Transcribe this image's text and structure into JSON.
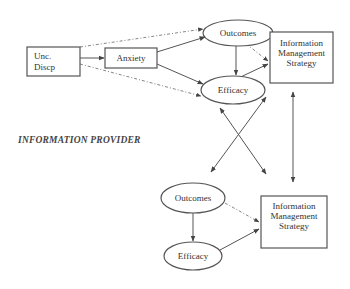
{
  "diagram": {
    "section_label": "INFORMATION PROVIDER",
    "upper": {
      "unc_discp": {
        "line1": "Unc.",
        "line2": "Discp"
      },
      "anxiety": "Anxiety",
      "outcomes": "Outcomes",
      "efficacy": "Efficacy",
      "ims": {
        "line1": "Information",
        "line2": "Management",
        "line3": "Strategy"
      }
    },
    "lower": {
      "outcomes": "Outcomes",
      "efficacy": "Efficacy",
      "ims": {
        "line1": "Information",
        "line2": "Management",
        "line3": "Strategy"
      }
    },
    "edges": [
      {
        "from": "Unc. Discp",
        "to": "Anxiety",
        "style": "solid"
      },
      {
        "from": "Unc. Discp",
        "to": "Outcomes (upper)",
        "style": "dashed"
      },
      {
        "from": "Unc. Discp",
        "to": "Efficacy (upper)",
        "style": "dashed"
      },
      {
        "from": "Anxiety",
        "to": "Outcomes (upper)",
        "style": "solid"
      },
      {
        "from": "Anxiety",
        "to": "Efficacy (upper)",
        "style": "solid"
      },
      {
        "from": "Outcomes (upper)",
        "to": "Efficacy (upper)",
        "style": "solid"
      },
      {
        "from": "Outcomes (upper)",
        "to": "Information Management Strategy (upper)",
        "style": "dashed"
      },
      {
        "from": "Efficacy (upper)",
        "to": "Information Management Strategy (upper)",
        "style": "solid"
      },
      {
        "from": "Efficacy (upper)",
        "to": "Information Management Strategy (lower)",
        "style": "solid",
        "bidirectional": true
      },
      {
        "from": "Information Management Strategy (upper)",
        "to": "Outcomes (lower)",
        "style": "solid",
        "bidirectional": true
      },
      {
        "from": "Information Management Strategy (upper)",
        "to": "Information Management Strategy (lower)",
        "style": "solid",
        "bidirectional": true
      },
      {
        "from": "Outcomes (lower)",
        "to": "Efficacy (lower)",
        "style": "solid"
      },
      {
        "from": "Outcomes (lower)",
        "to": "Information Management Strategy (lower)",
        "style": "dashed"
      },
      {
        "from": "Efficacy (lower)",
        "to": "Information Management Strategy (lower)",
        "style": "solid"
      }
    ]
  }
}
